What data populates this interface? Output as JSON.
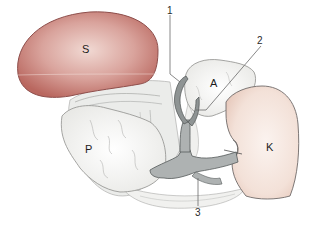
{
  "diagram": {
    "type": "anatomical-illustration",
    "organ_labels": [
      {
        "id": "S",
        "text": "S",
        "color": "#c77d78"
      },
      {
        "id": "A",
        "text": "A",
        "color": "#f4f2ee"
      },
      {
        "id": "P",
        "text": "P",
        "color": "#f3f3f1"
      },
      {
        "id": "K",
        "text": "K",
        "color": "#f2dfd6"
      }
    ],
    "callouts": [
      {
        "id": "1",
        "text": "1"
      },
      {
        "id": "2",
        "text": "2"
      },
      {
        "id": "3",
        "text": "3"
      }
    ],
    "colors": {
      "organ_S_fill": "#c77d78",
      "organ_S_edge": "#8e4f4c",
      "organ_K_fill": "#f3e2da",
      "organ_K_edge": "#6f6a69",
      "vessel_fill": "#a9aeae",
      "vessel_edge": "#555a5a",
      "tissue_fill": "#f4f4f2",
      "tissue_edge": "#9a9a98",
      "leader_line": "#6a6a6a"
    }
  }
}
